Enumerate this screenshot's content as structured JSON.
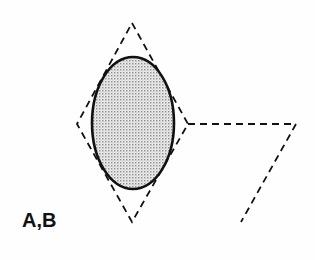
{
  "diagram": {
    "label": "A,B",
    "colors": {
      "line": "#111111",
      "fill": "#d8d8d8",
      "background": "#fefefe"
    },
    "shapes": {
      "diamond": {
        "top": [
          132,
          23
        ],
        "right": [
          188,
          124
        ],
        "bottom": [
          132,
          222
        ],
        "left": [
          77,
          124
        ],
        "style": "dashed"
      },
      "ellipse": {
        "cx": 133,
        "cy": 123,
        "rx": 41,
        "ry": 66,
        "style": "solid",
        "fill": "stippled"
      },
      "open_path": {
        "points": [
          [
            188,
            124
          ],
          [
            296,
            124
          ],
          [
            241,
            222
          ]
        ],
        "style": "dashed"
      }
    }
  }
}
